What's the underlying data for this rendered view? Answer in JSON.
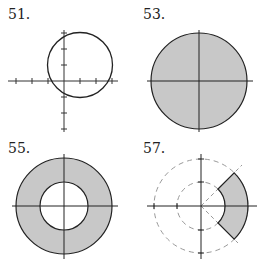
{
  "figures": [
    {
      "label": "51.",
      "description": "Circle (unshaded) centered at (1,1) radius 2 with tick-marked axes"
    },
    {
      "label": "53.",
      "description": "Shaded disk centered at origin"
    },
    {
      "label": "55.",
      "description": "Shaded annulus centered at origin"
    },
    {
      "label": "57.",
      "description": "Shaded annular sector between r=1 and r=2 for -pi/4 to pi/4 with dashed guide circles and rays"
    }
  ],
  "colors": {
    "fill": "#c8c8c8",
    "stroke": "#222222",
    "dashed": "#999999"
  }
}
